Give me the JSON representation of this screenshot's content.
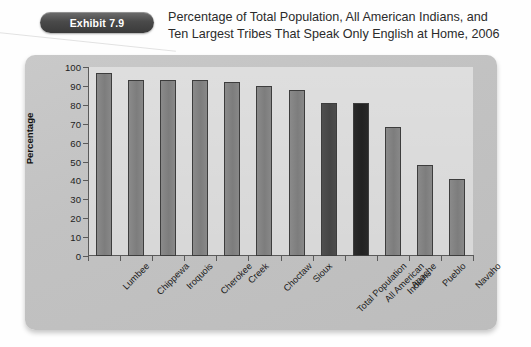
{
  "exhibit": {
    "badge_label": "Exhibit 7.9",
    "title_line1": "Percentage of Total Population, All American Indians, and",
    "title_line2": "Ten Largest Tribes That Speak Only English at Home, 2006"
  },
  "colors": {
    "bar_normal": "#7d7d7d",
    "bar_dark": "#454545",
    "bar_darkest": "#222222",
    "panel_bg": "#c4c4c4",
    "plot_bg": "#d7d7d7",
    "axis": "#5a5a5a",
    "badge_bg": "#3a3a3a",
    "text": "#1e1e1e"
  },
  "chart_data": {
    "type": "bar",
    "title": "Percentage of Total Population, All American Indians, and Ten Largest Tribes That Speak Only English at Home, 2006",
    "xlabel": "",
    "ylabel": "Percentage",
    "ylim": [
      0,
      100
    ],
    "yticks": [
      0,
      10,
      20,
      30,
      40,
      50,
      60,
      70,
      80,
      90,
      100
    ],
    "ytick_labels": [
      "0",
      "10",
      "20",
      "30",
      "40",
      "50",
      "60",
      "70",
      "80",
      "90",
      "100"
    ],
    "grid": false,
    "legend": "none",
    "categories": [
      "Lumbee",
      "Chippewa",
      "Iroquois",
      "Cherokee",
      "Creek",
      "Choctaw",
      "Sioux",
      "Total Population",
      "All American Indians",
      "Apache",
      "Pueblo",
      "Navaho"
    ],
    "category_label_lines": [
      [
        "Lumbee"
      ],
      [
        "Chippewa"
      ],
      [
        "Iroquois"
      ],
      [
        "Cherokee"
      ],
      [
        "Creek"
      ],
      [
        "Choctaw"
      ],
      [
        "Sioux"
      ],
      [
        "Total Population"
      ],
      [
        "All American",
        "Indians"
      ],
      [
        "Apache"
      ],
      [
        "Pueblo"
      ],
      [
        "Navaho"
      ]
    ],
    "values": [
      97,
      93,
      93,
      93,
      92,
      90,
      88,
      81,
      81,
      68,
      48,
      41
    ],
    "bar_styles": [
      "normal",
      "normal",
      "normal",
      "normal",
      "normal",
      "normal",
      "normal",
      "dark",
      "darkest",
      "normal",
      "normal",
      "normal"
    ]
  }
}
